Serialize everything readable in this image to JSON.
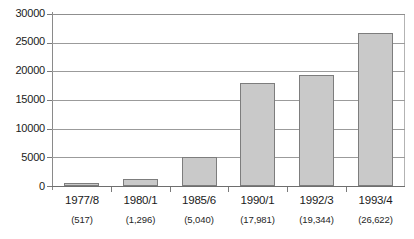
{
  "chart_data": {
    "type": "bar",
    "title": "",
    "subtitle": "",
    "xlabel": "",
    "ylabel": "",
    "categories": [
      "1977/8",
      "1980/1",
      "1985/6",
      "1990/1",
      "1992/3",
      "1993/4"
    ],
    "category_value_labels": [
      "(517)",
      "(1,296)",
      "(5,040)",
      "(17,981)",
      "(19,344)",
      "(26,622)"
    ],
    "values": [
      517,
      1296,
      5040,
      17981,
      19344,
      26622
    ],
    "ylim": [
      0,
      30000
    ],
    "ytick_values": [
      0,
      5000,
      10000,
      15000,
      20000,
      25000,
      30000
    ],
    "ytick_labels": [
      "0",
      "5000",
      "10000",
      "15000",
      "20000",
      "25000",
      "30000"
    ],
    "grid": true,
    "legend": false,
    "legend_position": "none",
    "series": [
      {
        "name": "",
        "values": [
          517,
          1296,
          5040,
          17981,
          19344,
          26622
        ]
      }
    ],
    "colors": {
      "bar_fill": "#c9c9c9",
      "bar_border": "#7d7d7d",
      "gridline": "#9b9b9b",
      "axis": "#8a8a8a",
      "text": "#1a1a1a",
      "background": "#ffffff"
    }
  }
}
